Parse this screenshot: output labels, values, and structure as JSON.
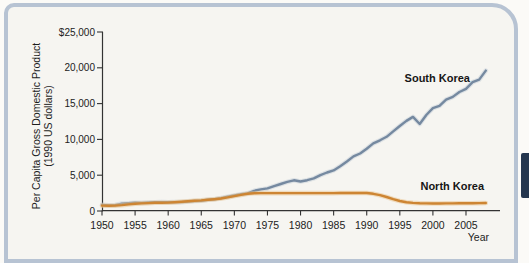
{
  "chart": {
    "y_axis_title_line1": "Per Capita Gross Domestic Product",
    "y_axis_title_line2": "(1990 US dollars)"
  },
  "colors": {
    "frame_border": "#b7c3d3",
    "navy_tab": "#24364e",
    "south_korea_line": "#7589a0",
    "north_korea_line": "#cd8533",
    "axis": "#333333"
  },
  "chart_data": {
    "type": "line",
    "title": "",
    "xlabel": "Year",
    "ylabel": "Per Capita Gross Domestic Product (1990 US dollars)",
    "xlim": [
      1950,
      2009
    ],
    "ylim": [
      0,
      25000
    ],
    "grid": false,
    "legend_position": "inline-labels",
    "x_start": 1950,
    "x_step": 1,
    "x_ticks": [
      {
        "value": 1950,
        "label": "1950"
      },
      {
        "value": 1955,
        "label": "1955"
      },
      {
        "value": 1960,
        "label": "1960"
      },
      {
        "value": 1965,
        "label": "1965"
      },
      {
        "value": 1970,
        "label": "1970"
      },
      {
        "value": 1975,
        "label": "1975"
      },
      {
        "value": 1980,
        "label": "1980"
      },
      {
        "value": 1985,
        "label": "1985"
      },
      {
        "value": 1990,
        "label": "1990"
      },
      {
        "value": 1995,
        "label": "1995"
      },
      {
        "value": 2000,
        "label": "2000"
      },
      {
        "value": 2005,
        "label": "2005"
      }
    ],
    "y_ticks": [
      {
        "value": 0,
        "label": "0"
      },
      {
        "value": 5000,
        "label": "5,000"
      },
      {
        "value": 10000,
        "label": "10,000"
      },
      {
        "value": 15000,
        "label": "15,000"
      },
      {
        "value": 20000,
        "label": "20,000"
      },
      {
        "value": 25000,
        "label": "$25,000"
      }
    ],
    "series": [
      {
        "name": "South Korea",
        "color": "#7589a0",
        "halo": "#c3cdd8",
        "values": [
          854,
          780,
          820,
          1030,
          1090,
          1140,
          1125,
          1190,
          1230,
          1240,
          1226,
          1250,
          1245,
          1320,
          1390,
          1436,
          1570,
          1645,
          1805,
          2000,
          2167,
          2330,
          2456,
          2820,
          3015,
          3162,
          3476,
          3775,
          4064,
          4294,
          4114,
          4300,
          4557,
          5007,
          5375,
          5670,
          6260,
          6916,
          7620,
          8027,
          8704,
          9445,
          9880,
          10360,
          11125,
          11873,
          12587,
          13137,
          12152,
          13403,
          14375,
          14673,
          15556,
          15929,
          16622,
          17051,
          17983,
          18356,
          19614
        ]
      },
      {
        "name": "North Korea",
        "color": "#cd8533",
        "halo": "#eac28a",
        "values": [
          750,
          720,
          760,
          830,
          920,
          1010,
          1060,
          1100,
          1140,
          1160,
          1180,
          1230,
          1290,
          1350,
          1420,
          1480,
          1560,
          1650,
          1750,
          1900,
          2080,
          2250,
          2420,
          2480,
          2500,
          2500,
          2500,
          2500,
          2500,
          2500,
          2500,
          2500,
          2500,
          2500,
          2500,
          2500,
          2510,
          2510,
          2520,
          2520,
          2520,
          2400,
          2200,
          1950,
          1650,
          1400,
          1230,
          1130,
          1080,
          1060,
          1050,
          1050,
          1060,
          1060,
          1070,
          1070,
          1090,
          1100,
          1120
        ]
      }
    ]
  }
}
